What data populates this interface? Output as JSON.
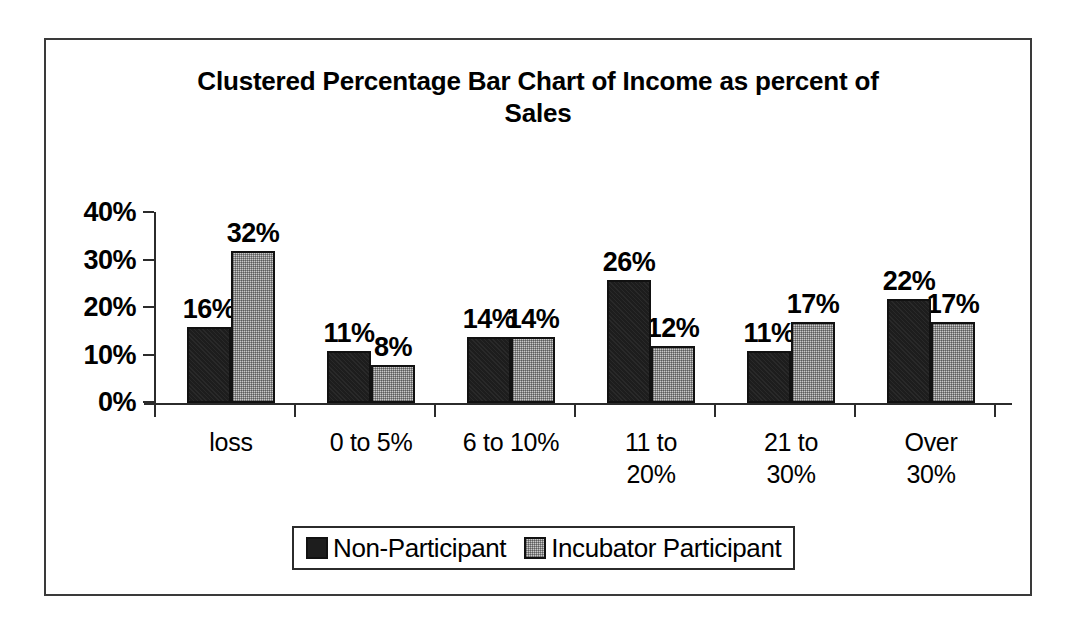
{
  "chart_data": {
    "type": "bar",
    "title": "Clustered Percentage Bar Chart of Income as percent of Sales",
    "xlabel": "",
    "ylabel": "",
    "ylim": [
      0,
      40
    ],
    "grid": false,
    "legend_position": "bottom",
    "categories": [
      "loss",
      "0 to 5%",
      "6 to 10%",
      "11 to\n20%",
      "21 to\n30%",
      "Over\n30%"
    ],
    "ytick_labels": [
      "0%",
      "10%",
      "20%",
      "30%",
      "40%"
    ],
    "ytick_values": [
      0,
      10,
      20,
      30,
      40
    ],
    "series": [
      {
        "name": "Non-Participant",
        "color": "#1d1d1d",
        "values": [
          16,
          11,
          14,
          26,
          11,
          22
        ],
        "labels": [
          "16%",
          "11%",
          "14%",
          "26%",
          "11%",
          "22%"
        ]
      },
      {
        "name": "Incubator Participant",
        "color": "#c9c9c9",
        "values": [
          32,
          8,
          14,
          12,
          17,
          17
        ],
        "labels": [
          "32%",
          "8%",
          "14%",
          "12%",
          "17%",
          "17%"
        ]
      }
    ]
  },
  "legend": {
    "entries": [
      {
        "label": "Non-Participant"
      },
      {
        "label": "Incubator Participant"
      }
    ]
  }
}
